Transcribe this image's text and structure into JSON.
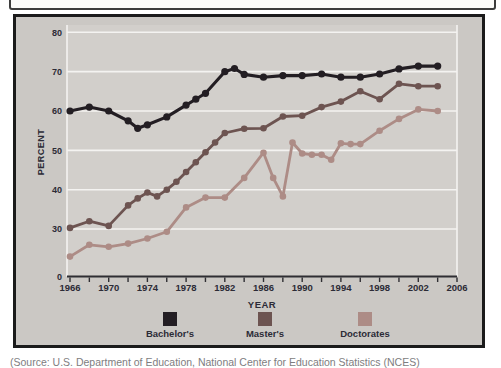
{
  "page": {
    "caption_partial": "(Source: U.S. Department of Education, National Center for Education Statistics (NCES)"
  },
  "chart_data": {
    "type": "line",
    "title": "",
    "xlabel": "YEAR",
    "ylabel": "PERCENT",
    "xlim": [
      1966,
      2006
    ],
    "x_tick_labels": [
      "1966",
      "1970",
      "1974",
      "1978",
      "1982",
      "1986",
      "1990",
      "1994",
      "1998",
      "2002",
      "2006"
    ],
    "x_minor_tick_step_years": 2,
    "y_gridline_values": [
      80,
      70,
      60,
      50,
      40,
      30
    ],
    "y_baseline_label": "0",
    "grid": "horizontal white gridlines on gray plot background",
    "legend_position": "bottom-center",
    "series": [
      {
        "name": "Bachelor's",
        "color": "#231e23",
        "points": [
          [
            1966,
            60
          ],
          [
            1968,
            61
          ],
          [
            1970,
            60
          ],
          [
            1972,
            57.5
          ],
          [
            1973,
            55.6
          ],
          [
            1974,
            56.5
          ],
          [
            1976,
            58.5
          ],
          [
            1978,
            61.5
          ],
          [
            1979,
            63
          ],
          [
            1980,
            64.5
          ],
          [
            1982,
            70
          ],
          [
            1983,
            70.8
          ],
          [
            1984,
            69.3
          ],
          [
            1986,
            68.6
          ],
          [
            1988,
            69
          ],
          [
            1990,
            69
          ],
          [
            1992,
            69.4
          ],
          [
            1994,
            68.6
          ],
          [
            1996,
            68.6
          ],
          [
            1998,
            69.4
          ],
          [
            2000,
            70.7
          ],
          [
            2002,
            71.4
          ],
          [
            2004,
            71.4
          ]
        ]
      },
      {
        "name": "Master's",
        "color": "#6d5451",
        "points": [
          [
            1966,
            30.3
          ],
          [
            1968,
            32
          ],
          [
            1970,
            30.8
          ],
          [
            1972,
            36
          ],
          [
            1973,
            37.8
          ],
          [
            1974,
            39.3
          ],
          [
            1975,
            38.3
          ],
          [
            1976,
            40
          ],
          [
            1977,
            42
          ],
          [
            1978,
            44.5
          ],
          [
            1979,
            47
          ],
          [
            1980,
            49.5
          ],
          [
            1981,
            52
          ],
          [
            1982,
            54.4
          ],
          [
            1984,
            55.5
          ],
          [
            1986,
            55.6
          ],
          [
            1988,
            58.6
          ],
          [
            1990,
            58.8
          ],
          [
            1992,
            61
          ],
          [
            1994,
            62.4
          ],
          [
            1996,
            65
          ],
          [
            1998,
            63
          ],
          [
            2000,
            66.9
          ],
          [
            2002,
            66.3
          ],
          [
            2004,
            66.3
          ]
        ]
      },
      {
        "name": "Doctorates",
        "color": "#ad8c86",
        "points": [
          [
            1966,
            23
          ],
          [
            1968,
            26
          ],
          [
            1970,
            25.5
          ],
          [
            1972,
            26.3
          ],
          [
            1974,
            27.6
          ],
          [
            1976,
            29.3
          ],
          [
            1978,
            35.5
          ],
          [
            1980,
            38
          ],
          [
            1982,
            38
          ],
          [
            1984,
            43
          ],
          [
            1986,
            49.4
          ],
          [
            1987,
            43
          ],
          [
            1988,
            38.3
          ],
          [
            1989,
            52
          ],
          [
            1990,
            49.2
          ],
          [
            1991,
            48.9
          ],
          [
            1992,
            48.9
          ],
          [
            1993,
            47.6
          ],
          [
            1994,
            51.8
          ],
          [
            1995,
            51.6
          ],
          [
            1996,
            51.6
          ],
          [
            1998,
            55
          ],
          [
            2000,
            58
          ],
          [
            2002,
            60.4
          ],
          [
            2004,
            60
          ]
        ]
      }
    ]
  },
  "colors": {
    "panel_bg": "#cbc8c4",
    "plot_bg": "#d2cfcb",
    "gridline": "#f4f3f1",
    "axis_text": "#2c2b36",
    "axis_line": "#2f2e33"
  }
}
